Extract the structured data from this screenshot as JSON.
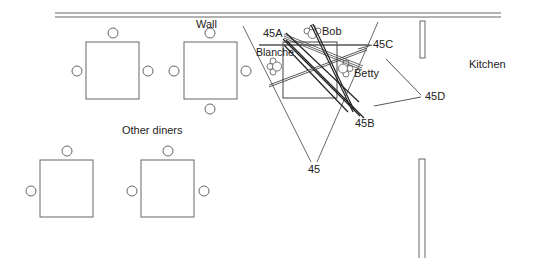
{
  "labels": {
    "wall": "Wall",
    "kitchen": "Kitchen",
    "other_diners": "Other diners",
    "blanche": "Blanche",
    "bob": "Bob",
    "betty": "Betty",
    "ref_45": "45",
    "ref_45a": "45A",
    "ref_45b": "45B",
    "ref_45c": "45C",
    "ref_45d": "45D"
  },
  "colors": {
    "line": "#555555",
    "dark_line": "#222222",
    "text": "#222222",
    "background": "#ffffff"
  },
  "tables": [
    {
      "name": "other-table-1",
      "chairs": 3
    },
    {
      "name": "other-table-2",
      "chairs": 4
    },
    {
      "name": "other-table-3",
      "chairs": 2
    },
    {
      "name": "other-table-4",
      "chairs": 3
    },
    {
      "name": "main-table",
      "diners": [
        "Blanche",
        "Bob",
        "Betty"
      ]
    }
  ]
}
